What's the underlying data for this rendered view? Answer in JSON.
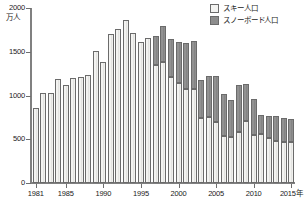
{
  "chart_data": {
    "type": "bar",
    "subtype": "stacked-bar",
    "title": "",
    "xlabel": "年",
    "ylabel": "万人",
    "ylim": [
      0,
      2000
    ],
    "y_ticks": [
      0,
      500,
      1000,
      1500,
      2000
    ],
    "y_tick_labels": [
      "0",
      "500",
      "1000",
      "1500",
      "2000"
    ],
    "grid": false,
    "legend_position": "top-right",
    "x_tick_labels": [
      "1981",
      "1985",
      "1990",
      "1995",
      "2000",
      "2005",
      "2010",
      "2015年"
    ],
    "x_tick_years": [
      1981,
      1985,
      1990,
      1995,
      2000,
      2005,
      2010,
      2015
    ],
    "categories": [
      "1981",
      "1982",
      "1983",
      "1984",
      "1985",
      "1986",
      "1987",
      "1988",
      "1989",
      "1990",
      "1991",
      "1992",
      "1993",
      "1994",
      "1995",
      "1996",
      "1997",
      "1998",
      "1999",
      "2000",
      "2001",
      "2002",
      "2003",
      "2004",
      "2005",
      "2006",
      "2007",
      "2008",
      "2009",
      "2010",
      "2011",
      "2012",
      "2013",
      "2014",
      "2015"
    ],
    "series": [
      {
        "name": "スキー人口",
        "color": "#f3f3f1",
        "values": [
          860,
          1030,
          1030,
          1190,
          1120,
          1200,
          1210,
          1230,
          1510,
          1380,
          1700,
          1760,
          1860,
          1720,
          1610,
          1660,
          1350,
          1380,
          1210,
          1140,
          1080,
          1070,
          740,
          750,
          700,
          540,
          530,
          580,
          710,
          550,
          560,
          520,
          480,
          470,
          470
        ]
      },
      {
        "name": "スノーボード人口",
        "color": "#8d8d8d",
        "values": [
          0,
          0,
          0,
          0,
          0,
          0,
          0,
          0,
          0,
          0,
          0,
          0,
          0,
          0,
          0,
          0,
          330,
          420,
          440,
          470,
          520,
          550,
          440,
          470,
          520,
          480,
          420,
          540,
          420,
          410,
          220,
          250,
          290,
          270,
          260
        ]
      }
    ],
    "totals": [
      860,
      1030,
      1030,
      1190,
      1120,
      1200,
      1210,
      1230,
      1510,
      1380,
      1700,
      1760,
      1860,
      1720,
      1610,
      1660,
      1680,
      1800,
      1650,
      1610,
      1600,
      1620,
      1180,
      1220,
      1220,
      1020,
      950,
      1120,
      1130,
      960,
      780,
      770,
      770,
      740,
      730
    ]
  },
  "legend": {
    "items": [
      {
        "label": "スキー人口",
        "swatch": "light"
      },
      {
        "label": "スノーボード人口",
        "swatch": "dark"
      }
    ]
  },
  "axis": {
    "y_unit_label": "万人"
  }
}
